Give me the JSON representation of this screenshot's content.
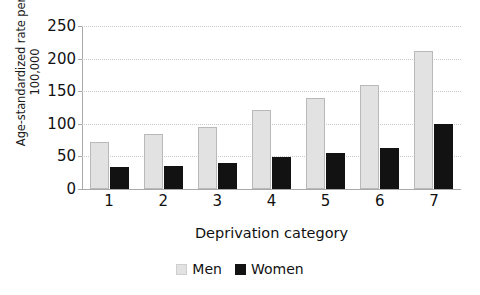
{
  "chart_data": {
    "type": "bar",
    "title": "",
    "xlabel": "Deprivation category",
    "ylabel": "Age-standardized rate per 100,000",
    "ylabel_lines": [
      "Age-standardized rate per",
      "100,000"
    ],
    "categories": [
      "1",
      "2",
      "3",
      "4",
      "5",
      "6",
      "7"
    ],
    "series": [
      {
        "name": "Men",
        "color": "#e2e2e2",
        "values": [
          72,
          85,
          95,
          121,
          140,
          160,
          211
        ]
      },
      {
        "name": "Women",
        "color": "#121212",
        "values": [
          34,
          36,
          40,
          49,
          55,
          63,
          100
        ]
      }
    ],
    "ylim": [
      0,
      250
    ],
    "ytick_labels": [
      "250",
      "200",
      "150",
      "100",
      "50",
      "0"
    ],
    "ytick_values": [
      250,
      200,
      150,
      100,
      50,
      0
    ],
    "grid": "horizontal-dotted",
    "grid_color": "#c9c9c9",
    "legend_position": "bottom-center",
    "axis_color": "#a9a9a9",
    "background": "#ffffff"
  }
}
